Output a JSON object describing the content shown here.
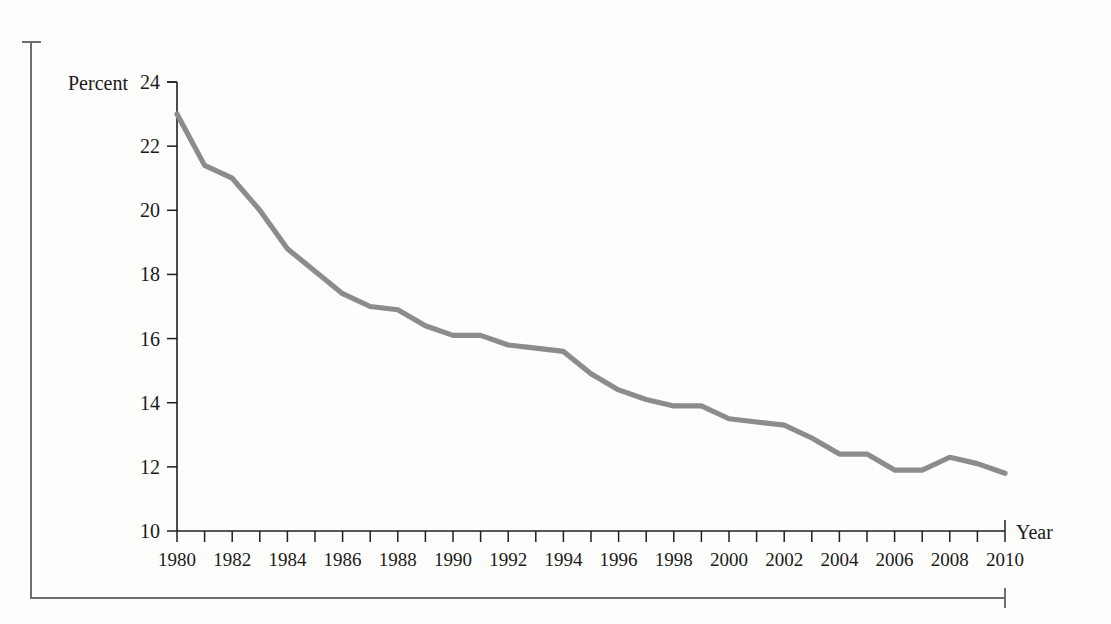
{
  "figure": {
    "background_color": "#fdfdfc",
    "frame_color": "#6f6f6f"
  },
  "chart_data": {
    "type": "line",
    "title": "",
    "xlabel": "Year",
    "ylabel": "Percent",
    "xlim": [
      1980,
      2010
    ],
    "ylim": [
      10,
      24
    ],
    "grid": false,
    "legend": false,
    "line_color": "#8c8c8c",
    "y_ticks": [
      10,
      12,
      14,
      16,
      18,
      20,
      22,
      24
    ],
    "y_tick_labels": [
      "10",
      "12",
      "14",
      "16",
      "18",
      "20",
      "22",
      "24"
    ],
    "x_ticks": [
      1980,
      1981,
      1982,
      1983,
      1984,
      1985,
      1986,
      1987,
      1988,
      1989,
      1990,
      1991,
      1992,
      1993,
      1994,
      1995,
      1996,
      1997,
      1998,
      1999,
      2000,
      2001,
      2002,
      2003,
      2004,
      2005,
      2006,
      2007,
      2008,
      2009,
      2010
    ],
    "x_tick_labels": [
      "1980",
      "",
      "1982",
      "",
      "1984",
      "",
      "1986",
      "",
      "1988",
      "",
      "1990",
      "",
      "1992",
      "",
      "1994",
      "",
      "1996",
      "",
      "1998",
      "",
      "2000",
      "",
      "2002",
      "",
      "2004",
      "",
      "2006",
      "",
      "2008",
      "",
      "2010"
    ],
    "x": [
      1980,
      1981,
      1982,
      1983,
      1984,
      1985,
      1986,
      1987,
      1988,
      1989,
      1990,
      1991,
      1992,
      1993,
      1994,
      1995,
      1996,
      1997,
      1998,
      1999,
      2000,
      2001,
      2002,
      2003,
      2004,
      2005,
      2006,
      2007,
      2008,
      2009,
      2010
    ],
    "values": [
      23.0,
      21.4,
      21.0,
      20.0,
      18.8,
      18.1,
      17.4,
      17.0,
      16.9,
      16.4,
      16.1,
      16.1,
      15.8,
      15.7,
      15.6,
      14.9,
      14.4,
      14.1,
      13.9,
      13.9,
      13.5,
      13.4,
      13.3,
      12.9,
      12.4,
      12.4,
      11.9,
      11.9,
      12.3,
      12.1,
      11.8
    ]
  }
}
